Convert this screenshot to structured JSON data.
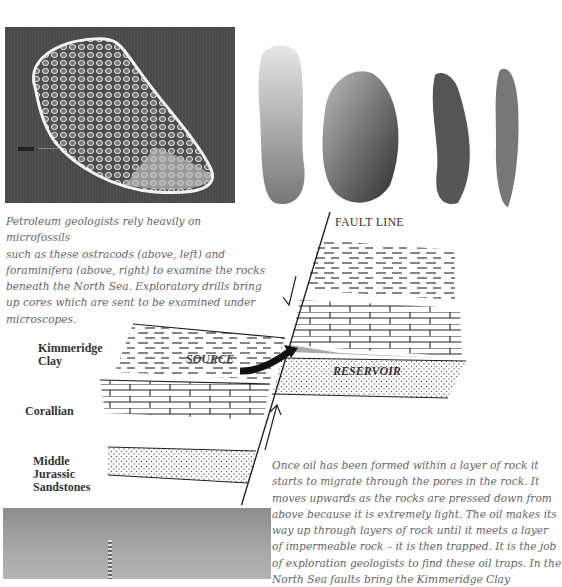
{
  "figures": {
    "ostracod_photo": {
      "alt": "SEM image of an ostracod microfossil",
      "scale_bar_label": "20µm"
    },
    "foraminifera_photo": {
      "alt": "Four foraminifera microfossils",
      "count": 4
    },
    "oil_rig_photo": {
      "alt": "Offshore drilling rig against grey sky"
    }
  },
  "caption": {
    "lines": [
      "Petroleum geologists rely heavily on microfossils",
      "such as these ostracods (above, left) and",
      "foraminifera (above, right) to examine the rocks",
      "beneath the North Sea. Exploratory drills bring",
      "up cores which are sent to be examined under",
      "microscopes."
    ]
  },
  "diagram": {
    "fault_label": "FAULT LINE",
    "source_label": "SOURCE",
    "reservoir_label": "RESERVOIR",
    "layers": [
      {
        "name_lines": [
          "Kimmeridge",
          "Clay"
        ]
      },
      {
        "name_lines": [
          "Corallian"
        ]
      },
      {
        "name_lines": [
          "Middle",
          "Jurassic",
          "Sandstones"
        ]
      }
    ]
  },
  "body": {
    "lines": [
      "Once oil has been formed within a layer of rock it",
      "starts to migrate through the pores in the rock. It",
      "moves upwards as the rocks are pressed down from",
      "above because it is extremely light. The oil makes its",
      "way up through layers of rock until it meets a layer",
      "of impermeable rock – it is then trapped. It is the job",
      "of exploration geologists to find these oil traps. In the",
      "North Sea faults bring the Kimmeridge Clay"
    ]
  }
}
